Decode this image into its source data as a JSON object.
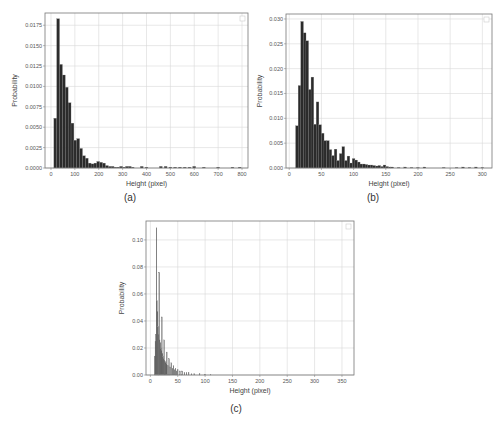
{
  "figure": {
    "panels": [
      {
        "id": "a",
        "caption": "(a)"
      },
      {
        "id": "b",
        "caption": "(b)"
      },
      {
        "id": "c",
        "caption": "(c)"
      }
    ]
  },
  "chart_data": [
    {
      "type": "bar",
      "panel": "(a)",
      "title": "",
      "xlabel": "Height (pixel)",
      "ylabel": "Probability",
      "xlim": [
        -25,
        825
      ],
      "ylim": [
        0,
        0.019
      ],
      "xticks": [
        0,
        100,
        200,
        300,
        400,
        500,
        600,
        700,
        800
      ],
      "yticks": [
        "0.0000",
        "0.0025",
        "0.0050",
        "0.0075",
        "0.0100",
        "0.0125",
        "0.0150",
        "0.0175"
      ],
      "ytick_values": [
        0,
        0.0025,
        0.005,
        0.0075,
        0.01,
        0.0125,
        0.015,
        0.0175
      ],
      "grid": true,
      "legend": "empty box, upper right",
      "bin_width": 12,
      "x": [
        18,
        30,
        42,
        54,
        66,
        78,
        90,
        102,
        114,
        126,
        138,
        150,
        162,
        174,
        186,
        198,
        210,
        222,
        234,
        246,
        258,
        270,
        282,
        294,
        306,
        318,
        330,
        342,
        380,
        400,
        460,
        480,
        500,
        520,
        540,
        560,
        580,
        600,
        640,
        700,
        760,
        790
      ],
      "values": [
        0.0061,
        0.0183,
        0.0127,
        0.0114,
        0.0099,
        0.008,
        0.0055,
        0.0034,
        0.0036,
        0.0024,
        0.0015,
        0.0012,
        0.0006,
        0.0005,
        0.0006,
        0.0008,
        0.0007,
        0.0006,
        0.0003,
        0.0002,
        0.0002,
        0.0001,
        0.0001,
        0.0002,
        0.0001,
        0.0002,
        0.0002,
        0.0001,
        0.0002,
        0.0001,
        0.0002,
        0.0002,
        0.0001,
        0.0001,
        0.0001,
        0.0001,
        0.0001,
        0.0002,
        0.0001,
        0.0001,
        0.0001,
        0.0001
      ]
    },
    {
      "type": "bar",
      "panel": "(b)",
      "title": "",
      "xlabel": "Height (pixel)",
      "ylabel": "Probability",
      "xlim": [
        -5,
        315
      ],
      "ylim": [
        0,
        0.031
      ],
      "xticks": [
        0,
        50,
        100,
        150,
        200,
        250,
        300
      ],
      "yticks": [
        "0.000",
        "0.005",
        "0.010",
        "0.015",
        "0.020",
        "0.025",
        "0.030"
      ],
      "ytick_values": [
        0,
        0.005,
        0.01,
        0.015,
        0.02,
        0.025,
        0.03
      ],
      "grid": true,
      "legend": "empty box, upper right",
      "bin_width": 4.2,
      "x": [
        12,
        16,
        20,
        24,
        28,
        32,
        36,
        40,
        44,
        48,
        52,
        56,
        60,
        64,
        68,
        72,
        76,
        80,
        84,
        88,
        92,
        96,
        100,
        104,
        108,
        112,
        116,
        120,
        124,
        128,
        132,
        136,
        140,
        144,
        148,
        152,
        156,
        160,
        170,
        180,
        190,
        200,
        210,
        240,
        260,
        270,
        280,
        290,
        300
      ],
      "values": [
        0.0085,
        0.0166,
        0.0295,
        0.0272,
        0.0256,
        0.0158,
        0.0183,
        0.0088,
        0.0133,
        0.0087,
        0.007,
        0.0055,
        0.0055,
        0.0037,
        0.0025,
        0.0038,
        0.0015,
        0.0029,
        0.0043,
        0.0015,
        0.0024,
        0.001,
        0.0019,
        0.0016,
        0.0012,
        0.0008,
        0.0008,
        0.0007,
        0.0006,
        0.0006,
        0.0005,
        0.0004,
        0.0005,
        0.0003,
        0.0006,
        0.0003,
        0.0002,
        0.0002,
        0.0001,
        0.0002,
        0.0001,
        0.0001,
        0.0002,
        0.0001,
        0.0001,
        0.0002,
        0.0001,
        0.0002,
        0.0001
      ]
    },
    {
      "type": "bar",
      "panel": "(c)",
      "title": "",
      "xlabel": "Height (pixel)",
      "ylabel": "Probability",
      "xlim": [
        -8,
        372
      ],
      "ylim": [
        0,
        0.114
      ],
      "xticks": [
        0,
        50,
        100,
        150,
        200,
        250,
        300,
        350
      ],
      "yticks": [
        "0.00",
        "0.02",
        "0.04",
        "0.06",
        "0.08",
        "0.10"
      ],
      "ytick_values": [
        0,
        0.02,
        0.04,
        0.06,
        0.08,
        0.1
      ],
      "grid": true,
      "legend": "empty box, upper right",
      "bin_width": 1,
      "x": [
        8,
        9,
        10,
        11,
        12,
        13,
        14,
        15,
        16,
        17,
        18,
        19,
        20,
        21,
        22,
        23,
        24,
        25,
        26,
        27,
        28,
        29,
        30,
        32,
        34,
        36,
        38,
        40,
        42,
        44,
        46,
        48,
        50,
        54,
        58,
        62,
        66,
        70,
        75,
        80,
        90,
        100,
        110
      ],
      "values": [
        0.014,
        0.025,
        0.03,
        0.109,
        0.055,
        0.047,
        0.036,
        0.03,
        0.076,
        0.026,
        0.024,
        0.02,
        0.018,
        0.043,
        0.016,
        0.014,
        0.012,
        0.026,
        0.011,
        0.01,
        0.009,
        0.008,
        0.017,
        0.007,
        0.012,
        0.006,
        0.009,
        0.005,
        0.007,
        0.004,
        0.005,
        0.003,
        0.004,
        0.003,
        0.003,
        0.002,
        0.002,
        0.002,
        0.001,
        0.001,
        0.001,
        0.0005,
        0.0003
      ]
    }
  ]
}
